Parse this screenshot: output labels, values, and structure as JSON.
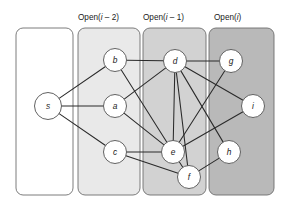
{
  "figure": {
    "title": "",
    "background": "#ffffff",
    "width": 288,
    "height": 207
  },
  "panels": [
    {
      "id": "panel-source",
      "label": "",
      "label_x": 0,
      "label_y": 0,
      "x": 16,
      "y": 28,
      "w": 57,
      "h": 167,
      "r": 7,
      "fill": "#ffffff",
      "stroke": "#6e6e6e"
    },
    {
      "id": "panel-open-i-minus-2",
      "label": "Open(i – 2)",
      "label_prefix": "Open(",
      "label_var": "i",
      "label_suffix": " – 2)",
      "label_x": 78,
      "label_y": 20,
      "x": 78,
      "y": 28,
      "w": 62,
      "h": 167,
      "r": 7,
      "fill": "#e9e9e9",
      "stroke": "#6e6e6e"
    },
    {
      "id": "panel-open-i-minus-1",
      "label": "Open(i – 1)",
      "label_prefix": "Open(",
      "label_var": "i",
      "label_suffix": " – 1)",
      "label_x": 143,
      "label_y": 20,
      "x": 143,
      "y": 28,
      "w": 63,
      "h": 167,
      "r": 7,
      "fill": "#d2d2d2",
      "stroke": "#6e6e6e"
    },
    {
      "id": "panel-open-i",
      "label": "Open(i)",
      "label_prefix": "Open(",
      "label_var": "i",
      "label_suffix": ")",
      "label_x": 214,
      "label_y": 20,
      "x": 209,
      "y": 28,
      "w": 65,
      "h": 167,
      "r": 7,
      "fill": "#b9b9b9",
      "stroke": "#6e6e6e"
    }
  ],
  "nodes": [
    {
      "id": "s",
      "label": "s",
      "x": 48,
      "y": 106,
      "r": 13.5
    },
    {
      "id": "b",
      "label": "b",
      "x": 115,
      "y": 60,
      "r": 11.5
    },
    {
      "id": "a",
      "label": "a",
      "x": 115,
      "y": 106,
      "r": 11.5
    },
    {
      "id": "c",
      "label": "c",
      "x": 115,
      "y": 152,
      "r": 11.5
    },
    {
      "id": "d",
      "label": "d",
      "x": 175,
      "y": 61,
      "r": 11.5
    },
    {
      "id": "e",
      "label": "e",
      "x": 173,
      "y": 152,
      "r": 11.5
    },
    {
      "id": "f",
      "label": "f",
      "x": 189,
      "y": 177,
      "r": 11.5
    },
    {
      "id": "g",
      "label": "g",
      "x": 231,
      "y": 61,
      "r": 11.5
    },
    {
      "id": "i",
      "label": "i",
      "x": 253,
      "y": 106,
      "r": 11.5
    },
    {
      "id": "h",
      "label": "h",
      "x": 229,
      "y": 152,
      "r": 11.5
    }
  ],
  "edges": [
    {
      "from": "s",
      "to": "b"
    },
    {
      "from": "s",
      "to": "a"
    },
    {
      "from": "s",
      "to": "c"
    },
    {
      "from": "b",
      "to": "d"
    },
    {
      "from": "b",
      "to": "e"
    },
    {
      "from": "a",
      "to": "d"
    },
    {
      "from": "a",
      "to": "e"
    },
    {
      "from": "c",
      "to": "e"
    },
    {
      "from": "c",
      "to": "f"
    },
    {
      "from": "d",
      "to": "e"
    },
    {
      "from": "d",
      "to": "f"
    },
    {
      "from": "d",
      "to": "g"
    },
    {
      "from": "d",
      "to": "i"
    },
    {
      "from": "d",
      "to": "h"
    },
    {
      "from": "e",
      "to": "f"
    },
    {
      "from": "e",
      "to": "g"
    },
    {
      "from": "e",
      "to": "i"
    },
    {
      "from": "f",
      "to": "h"
    }
  ],
  "colors": {
    "edge": "#2a2a2a",
    "node_fill": "#ffffff",
    "node_stroke": "#5a5a5a",
    "text": "#1a1a1a"
  }
}
